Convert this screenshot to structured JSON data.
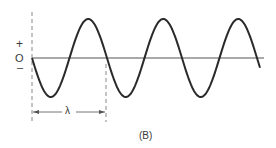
{
  "diagram": {
    "panel_label": "(B)",
    "axis_labels": {
      "plus": "+",
      "zero": "O",
      "minus": "–"
    },
    "wavelength_label": "λ",
    "colors": {
      "stroke": "#2a2a2a",
      "axis": "#555555",
      "dashed": "#777777"
    }
  }
}
